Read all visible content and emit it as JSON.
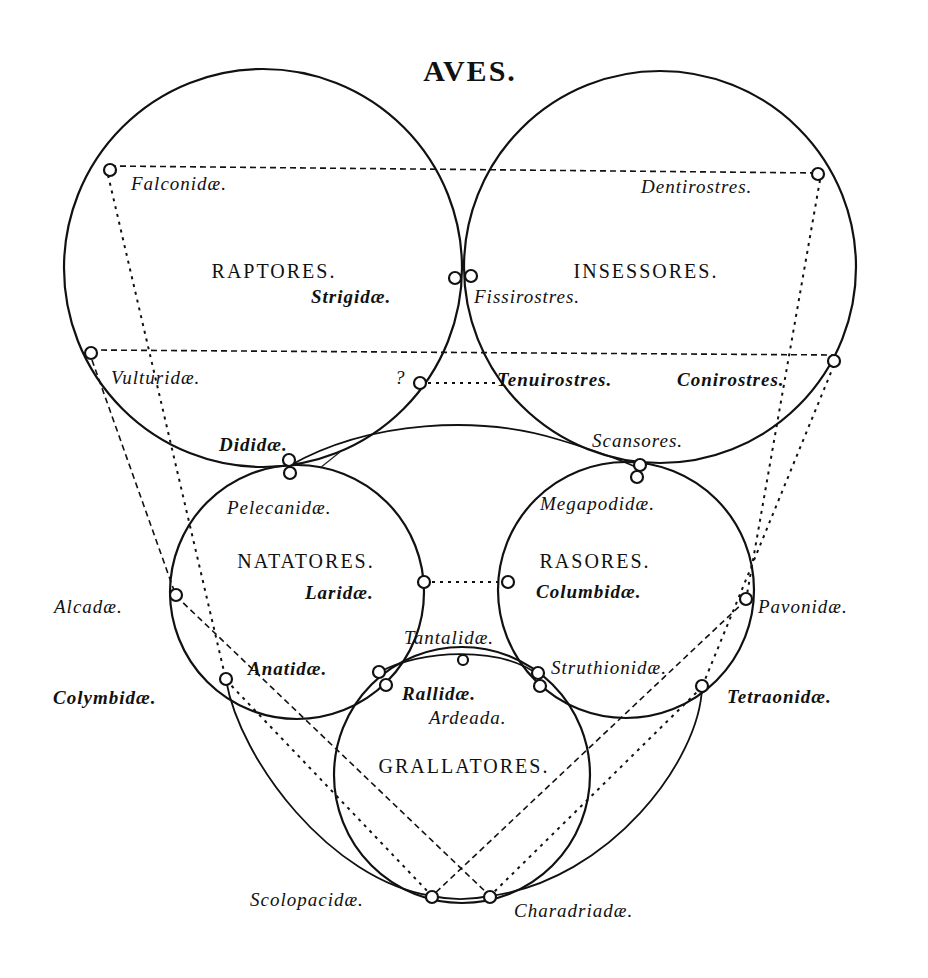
{
  "title": "AVES.",
  "orders": {
    "raptores": "RAPTORES.",
    "insessores": "INSESSORES.",
    "natatores": "NATATORES.",
    "rasores": "RASORES.",
    "grallatores": "GRALLATORES."
  },
  "families": {
    "falconidae": "Falconidæ.",
    "strigidae": "Strigidæ.",
    "vulturidae": "Vulturidæ.",
    "question": "?",
    "dididae": "Dididæ.",
    "dentirostres": "Dentirostres.",
    "fissirostres": "Fissirostres.",
    "tenuirostres": "Tenuirostres.",
    "conirostres": "Conirostres.",
    "scansores": "Scansores.",
    "pelecanidae": "Pelecanidæ.",
    "laridae": "Laridæ.",
    "alcadae": "Alcadæ.",
    "anatidae": "Anatidæ.",
    "colymbidae": "Colymbidæ.",
    "megapodidae": "Megapodidæ.",
    "columbidae": "Columbidæ.",
    "pavonidae": "Pavonidæ.",
    "tantalidae": "Tantalidæ.",
    "struthionidae": "Struthionidæ.",
    "tetraonidae": "Tetraonidæ.",
    "rallidae": "Rallidæ.",
    "ardeada": "Ardeada.",
    "scolopacidae": "Scolopacidæ.",
    "charadriadae": "Charadriadæ."
  }
}
